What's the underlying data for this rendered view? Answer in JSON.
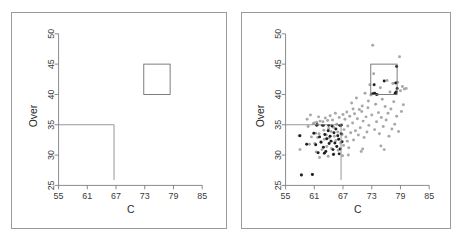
{
  "figure": {
    "name": "two-panel-partition-scatter",
    "panels": [
      {
        "id": "left",
        "title": "",
        "shows_points": false
      },
      {
        "id": "right",
        "title": "",
        "shows_points": true
      }
    ]
  },
  "chart_data": {
    "type": "scatter",
    "title": "",
    "xlabel": "C",
    "ylabel": "Over",
    "xlim": [
      55,
      85
    ],
    "ylim": [
      25,
      50
    ],
    "xticks": [
      55,
      61,
      67,
      73,
      79,
      85
    ],
    "yticks": [
      25,
      30,
      35,
      40,
      45,
      50
    ],
    "grid": false,
    "legend": null,
    "y_tick_rotation_deg": -90,
    "panels": [
      {
        "id": "left-panel",
        "name": "partition-diagram",
        "description": "Axes with partition boundary lines and one highlighted rectangular region; no data points shown.",
        "shapes": {
          "partition_lines": [
            {
              "name": "horizontal-split",
              "type": "hline",
              "y": 35,
              "x_from": 55,
              "x_to": 66.6
            },
            {
              "name": "vertical-split",
              "type": "vline",
              "x": 66.6,
              "y_from": 25.9,
              "y_to": 35
            }
          ],
          "boxes": [
            {
              "name": "upper-right-region",
              "x0": 72.8,
              "x1": 78.3,
              "y0": 40.0,
              "y1": 45.0
            }
          ]
        }
      },
      {
        "id": "right-panel",
        "name": "scatter-with-partition",
        "description": "Same axes overlaid with scatter data; light gray points are the full sample, dark points are a highlighted subgroup.",
        "shapes": {
          "partition_lines": [
            {
              "name": "horizontal-split",
              "type": "hline",
              "y": 35,
              "x_from": 55,
              "x_to": 66.6
            },
            {
              "name": "vertical-split",
              "type": "vline",
              "x": 66.6,
              "y_from": 25.9,
              "y_to": 35
            }
          ],
          "boxes": [
            {
              "name": "upper-right-region",
              "x0": 72.8,
              "x1": 78.3,
              "y0": 40.0,
              "y1": 45.0
            }
          ]
        },
        "series": [
          {
            "name": "all-observations",
            "marker": "filled-circle",
            "color": "#a8a8a8",
            "points": [
              [
                57.8,
                33.2
              ],
              [
                58.0,
                30.9
              ],
              [
                58.3,
                26.7
              ],
              [
                59.5,
                35.9
              ],
              [
                59.7,
                34.7
              ],
              [
                60.0,
                31.8
              ],
              [
                60.2,
                36.6
              ],
              [
                60.4,
                33.0
              ],
              [
                60.6,
                26.8
              ],
              [
                60.8,
                35.2
              ],
              [
                61.0,
                35.3
              ],
              [
                61.1,
                31.9
              ],
              [
                61.3,
                33.6
              ],
              [
                61.4,
                30.5
              ],
              [
                61.5,
                35.4
              ],
              [
                61.7,
                32.9
              ],
              [
                61.9,
                36.3
              ],
              [
                62.0,
                33.5
              ],
              [
                62.2,
                35.6
              ],
              [
                62.4,
                32.2
              ],
              [
                62.6,
                30.9
              ],
              [
                62.8,
                35.5
              ],
              [
                63.0,
                34.1
              ],
              [
                63.1,
                32.6
              ],
              [
                63.3,
                36.1
              ],
              [
                63.5,
                33.3
              ],
              [
                63.6,
                31.4
              ],
              [
                63.8,
                35.7
              ],
              [
                64.0,
                34.4
              ],
              [
                64.1,
                32.8
              ],
              [
                64.3,
                36.5
              ],
              [
                64.5,
                33.9
              ],
              [
                64.6,
                31.1
              ],
              [
                64.8,
                35.8
              ],
              [
                65.0,
                34.6
              ],
              [
                65.2,
                33.1
              ],
              [
                65.4,
                36.9
              ],
              [
                65.5,
                32.4
              ],
              [
                65.7,
                35.1
              ],
              [
                65.9,
                33.8
              ],
              [
                66.0,
                30.8
              ],
              [
                66.2,
                36.2
              ],
              [
                66.4,
                34.9
              ],
              [
                66.5,
                32.0
              ],
              [
                66.7,
                35.0
              ],
              [
                66.8,
                33.4
              ],
              [
                67.0,
                36.7
              ],
              [
                67.1,
                31.6
              ],
              [
                67.2,
                34.2
              ],
              [
                67.4,
                35.9
              ],
              [
                67.6,
                33.0
              ],
              [
                67.8,
                37.1
              ],
              [
                68.0,
                34.8
              ],
              [
                68.2,
                31.2
              ],
              [
                68.4,
                36.4
              ],
              [
                68.6,
                33.7
              ],
              [
                68.8,
                38.6
              ],
              [
                69.0,
                35.3
              ],
              [
                69.2,
                32.5
              ],
              [
                69.4,
                36.8
              ],
              [
                69.6,
                34.0
              ],
              [
                69.8,
                39.4
              ],
              [
                70.0,
                36.0
              ],
              [
                70.2,
                33.3
              ],
              [
                70.4,
                37.5
              ],
              [
                70.6,
                34.5
              ],
              [
                70.8,
                30.6
              ],
              [
                71.0,
                38.1
              ],
              [
                71.2,
                35.6
              ],
              [
                71.4,
                32.9
              ],
              [
                71.6,
                40.2
              ],
              [
                71.8,
                36.3
              ],
              [
                72.0,
                33.8
              ],
              [
                72.2,
                37.8
              ],
              [
                72.4,
                34.9
              ],
              [
                72.6,
                41.6
              ],
              [
                72.8,
                39.9
              ],
              [
                73.0,
                36.6
              ],
              [
                73.2,
                48.1
              ],
              [
                73.4,
                43.4
              ],
              [
                73.6,
                34.2
              ],
              [
                73.8,
                38.4
              ],
              [
                74.0,
                35.5
              ],
              [
                74.2,
                40.0
              ],
              [
                74.4,
                37.0
              ],
              [
                74.6,
                33.5
              ],
              [
                74.8,
                41.1
              ],
              [
                75.0,
                36.2
              ],
              [
                75.2,
                39.2
              ],
              [
                75.4,
                34.7
              ],
              [
                75.6,
                30.9
              ],
              [
                75.8,
                38.0
              ],
              [
                76.0,
                35.8
              ],
              [
                76.2,
                42.3
              ],
              [
                76.4,
                36.9
              ],
              [
                76.6,
                33.1
              ],
              [
                76.8,
                40.4
              ],
              [
                77.0,
                37.6
              ],
              [
                77.2,
                34.3
              ],
              [
                77.4,
                41.8
              ],
              [
                77.6,
                38.8
              ],
              [
                77.8,
                35.1
              ],
              [
                78.0,
                40.1
              ],
              [
                78.2,
                36.4
              ],
              [
                78.4,
                42.0
              ],
              [
                78.6,
                33.9
              ],
              [
                78.8,
                46.2
              ],
              [
                79.0,
                40.6
              ],
              [
                79.2,
                37.2
              ],
              [
                79.4,
                41.3
              ],
              [
                79.6,
                38.3
              ],
              [
                79.8,
                40.9
              ],
              [
                80.2,
                41.0
              ],
              [
                72.3,
                38.9
              ],
              [
                70.9,
                37.2
              ],
              [
                69.1,
                37.6
              ],
              [
                67.9,
                32.3
              ],
              [
                66.9,
                29.9
              ],
              [
                65.1,
                30.2
              ],
              [
                63.9,
                29.8
              ],
              [
                62.1,
                29.6
              ],
              [
                68.1,
                30.0
              ],
              [
                74.9,
                31.5
              ],
              [
                71.1,
                31.0
              ]
            ]
          },
          {
            "name": "highlighted-subgroup",
            "marker": "filled-circle",
            "color": "#1e1e1e",
            "points": [
              [
                58.0,
                33.2
              ],
              [
                58.3,
                26.7
              ],
              [
                59.4,
                31.8
              ],
              [
                60.6,
                26.8
              ],
              [
                60.9,
                33.6
              ],
              [
                61.3,
                31.7
              ],
              [
                61.6,
                35.0
              ],
              [
                61.8,
                30.4
              ],
              [
                62.1,
                33.0
              ],
              [
                62.4,
                32.1
              ],
              [
                62.7,
                34.9
              ],
              [
                62.9,
                31.3
              ],
              [
                63.2,
                33.4
              ],
              [
                63.4,
                30.6
              ],
              [
                63.6,
                32.7
              ],
              [
                63.9,
                34.0
              ],
              [
                64.1,
                31.9
              ],
              [
                64.3,
                33.1
              ],
              [
                64.5,
                32.3
              ],
              [
                64.7,
                34.8
              ],
              [
                64.9,
                30.9
              ],
              [
                65.1,
                33.7
              ],
              [
                65.3,
                32.0
              ],
              [
                65.5,
                34.3
              ],
              [
                65.7,
                31.4
              ],
              [
                65.9,
                33.2
              ],
              [
                66.1,
                32.6
              ],
              [
                66.3,
                34.9
              ],
              [
                66.4,
                31.0
              ],
              [
                66.6,
                33.5
              ],
              [
                66.6,
                34.9
              ],
              [
                66.8,
                32.2
              ],
              [
                64.0,
                34.9
              ],
              [
                62.9,
                34.9
              ],
              [
                61.5,
                34.9
              ],
              [
                66.2,
                30.2
              ],
              [
                65.0,
                30.1
              ],
              [
                63.1,
                30.3
              ],
              [
                73.2,
                40.1
              ],
              [
                73.6,
                40.2
              ],
              [
                74.0,
                40.0
              ],
              [
                75.6,
                42.2
              ],
              [
                77.9,
                40.2
              ],
              [
                78.1,
                40.4
              ],
              [
                78.2,
                44.6
              ],
              [
                78.3,
                41.0
              ],
              [
                73.5,
                41.6
              ],
              [
                78.0,
                41.9
              ]
            ]
          }
        ]
      }
    ]
  },
  "labels": {
    "x_axis_title": "C",
    "y_axis_title": "Over",
    "xticks": [
      "55",
      "61",
      "67",
      "73",
      "79",
      "85"
    ],
    "yticks": [
      "25",
      "30",
      "35",
      "40",
      "45",
      "50"
    ]
  },
  "colors": {
    "frame": "#9a9a9a",
    "axis": "#7d7d7d",
    "partition": "#8a8a8a",
    "box": "#6e6e6e",
    "point_light": "#a8a8a8",
    "point_dark": "#1e1e1e",
    "text": "#2b2b2b",
    "background": "#ffffff"
  }
}
